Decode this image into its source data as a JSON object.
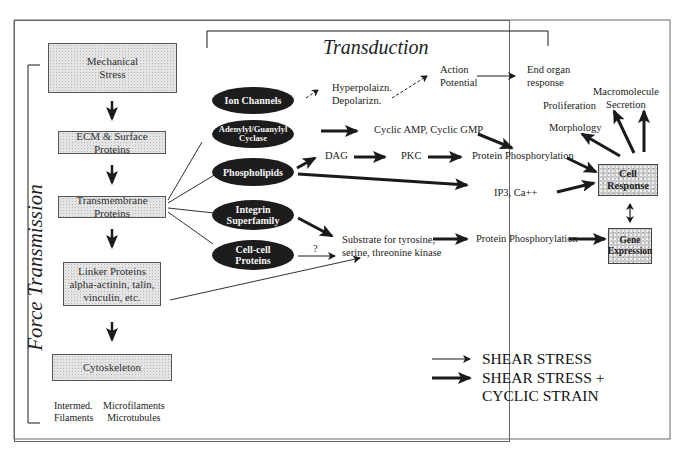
{
  "titles": {
    "transduction": "Transduction",
    "force_transmission": "Force Transmission"
  },
  "force_chain": [
    {
      "id": "mechanical-stress",
      "lines": [
        "Mechanical",
        "Stress"
      ]
    },
    {
      "id": "ecm-surface-proteins",
      "lines": [
        "ECM & Surface Proteins"
      ]
    },
    {
      "id": "transmembrane-proteins",
      "lines": [
        "Transmembrane Proteins"
      ]
    },
    {
      "id": "linker-proteins",
      "lines": [
        "Linker Proteins",
        "alpha-actinin, talin,",
        "vinculin, etc."
      ]
    },
    {
      "id": "cytoskeleton",
      "lines": [
        "Cytoskeleton"
      ]
    }
  ],
  "cytoskeleton_components": {
    "left": [
      "Intermed.",
      "Filaments"
    ],
    "right": [
      "Microfilaments",
      "Microtubules"
    ]
  },
  "transducers": [
    {
      "id": "ion-channels",
      "lines": [
        "Ion Channels"
      ]
    },
    {
      "id": "adenylyl-guanylyl-cyclase",
      "lines": [
        "Adenylyl/Guanylyl",
        "Cyclase"
      ]
    },
    {
      "id": "phospholipids",
      "lines": [
        "Phospholipids"
      ]
    },
    {
      "id": "integrin-superfamily",
      "lines": [
        "Integrin",
        "Superfamily"
      ]
    },
    {
      "id": "cell-cell-proteins",
      "lines": [
        "Cell-cell",
        "Proteins"
      ]
    }
  ],
  "intermediates": {
    "hyperpol": [
      "Hyperpolaizn.",
      "Depolarizn."
    ],
    "action_potential": [
      "Action",
      "Potential"
    ],
    "end_organ": [
      "End organ",
      "response"
    ],
    "cyclic": "Cyclic AMP, Cyclic GMP",
    "dag": "DAG",
    "pkc": "PKC",
    "protein_phos_1": "Protein Phosphorylation",
    "ip3": "IP3, Ca++",
    "substrate": [
      "Substrate for tyrosine,",
      "serine, threonine kinase"
    ],
    "question": "?",
    "protein_phos_2": "Protein Phosphorylation"
  },
  "outcomes": {
    "macromolecule": [
      "Macromolecule",
      "Secretion"
    ],
    "proliferation": "Proliferation",
    "morphology": "Morphology",
    "cell_response": [
      "Cell",
      "Response"
    ],
    "gene_expression": [
      "Gene",
      "Expression"
    ]
  },
  "legend": [
    {
      "style": "thin",
      "lines": [
        "SHEAR STRESS"
      ]
    },
    {
      "style": "thick",
      "lines": [
        "SHEAR STRESS +",
        "CYCLIC STRAIN"
      ]
    }
  ],
  "colors": {
    "oval_fill": "#1c1c1c",
    "oval_text": "#f4f4f4",
    "box_fill": "#e4e4e4",
    "line": "#1a1a1a",
    "frame": "#666666"
  }
}
